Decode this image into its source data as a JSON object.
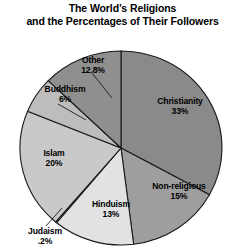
{
  "chart_title": {
    "line1": "The World’s Religions",
    "line2": "and the Percentages of Their Followers"
  },
  "labels": {
    "christianity": {
      "name": "Christianity",
      "percent": "33%"
    },
    "nonreligious": {
      "name": "Non-religious",
      "percent": "15%"
    },
    "hinduism": {
      "name": "Hinduism",
      "percent": "13%"
    },
    "judaism": {
      "name": "Judaism",
      "percent": ".2%"
    },
    "islam": {
      "name": "Islam",
      "percent": "20%"
    },
    "buddhism": {
      "name": "Buddhism",
      "percent": "6%"
    },
    "other": {
      "name": "Other",
      "percent": "12.8%"
    }
  },
  "chart_data": {
    "type": "pie",
    "title": "The World’s Religions and the Percentages of Their Followers",
    "xlabel": "",
    "ylabel": "",
    "grid": false,
    "legend": "none",
    "label_position": "inside-slice-with-leader-lines",
    "start_angle_deg": 0,
    "direction": "clockwise",
    "categories": [
      "Christianity",
      "Non-religious",
      "Hinduism",
      "Judaism",
      "Islam",
      "Buddhism",
      "Other"
    ],
    "values": [
      33,
      15,
      13,
      0.2,
      20,
      6,
      12.8
    ],
    "value_labels": [
      "33%",
      "15%",
      "13%",
      ".2%",
      "20%",
      "6%",
      "12.8%"
    ],
    "units": "percent",
    "slices": [
      {
        "label": "Christianity",
        "value": 33,
        "display": "33%",
        "color": "#8a8a8a"
      },
      {
        "label": "Non-religious",
        "value": 15,
        "display": "15%",
        "color": "#9e9e9e"
      },
      {
        "label": "Hinduism",
        "value": 13,
        "display": "13%",
        "color": "#e2e2e2"
      },
      {
        "label": "Judaism",
        "value": 0.2,
        "display": ".2%",
        "color": "#f2f2f2"
      },
      {
        "label": "Islam",
        "value": 20,
        "display": "20%",
        "color": "#c9c9c9"
      },
      {
        "label": "Buddhism",
        "value": 6,
        "display": "6%",
        "color": "#bdbdbd"
      },
      {
        "label": "Other",
        "value": 12.8,
        "display": "12.8%",
        "color": "#8f8f8f"
      }
    ]
  },
  "style": {
    "outline_color": "#1a1a1a",
    "background": "#ffffff",
    "text_color": "#000000"
  }
}
